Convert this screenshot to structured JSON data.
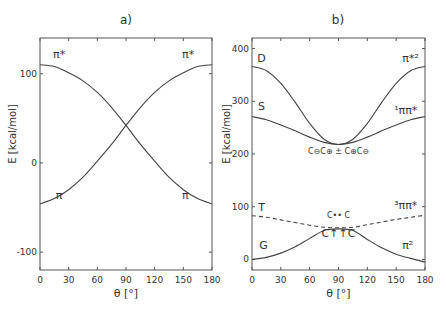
{
  "chart_data": [
    {
      "type": "line",
      "panel_label": "a)",
      "title": "a)",
      "xlabel": "θ [°]",
      "ylabel": "E [kcal/mol]",
      "xlim": [
        0,
        180
      ],
      "ylim": [
        -120,
        140
      ],
      "xticks": [
        0,
        30,
        60,
        90,
        120,
        150,
        180
      ],
      "yticks": [
        -100,
        0,
        100
      ],
      "grid": false,
      "x": [
        0,
        15,
        30,
        45,
        60,
        75,
        90,
        105,
        120,
        135,
        150,
        165,
        180
      ],
      "series": [
        {
          "name": "π*",
          "values": [
            110,
            108,
            101,
            92,
            79,
            62,
            42,
            21,
            2,
            -16,
            -30,
            -40,
            -46
          ]
        },
        {
          "name": "π",
          "values": [
            -46,
            -40,
            -30,
            -16,
            2,
            21,
            42,
            62,
            79,
            92,
            101,
            108,
            110
          ]
        }
      ],
      "annotations": [
        {
          "text": "π*",
          "x": 20,
          "y": 118
        },
        {
          "text": "π*",
          "x": 155,
          "y": 118
        },
        {
          "text": "π",
          "x": 20,
          "y": -40
        },
        {
          "text": "π",
          "x": 152,
          "y": -40
        }
      ]
    },
    {
      "type": "line",
      "panel_label": "b)",
      "title": "b)",
      "xlabel": "θ [°]",
      "ylabel": "E [kcal/mol]",
      "xlim": [
        0,
        180
      ],
      "ylim": [
        -20,
        420
      ],
      "xticks": [
        0,
        30,
        60,
        90,
        120,
        150,
        180
      ],
      "yticks": [
        0,
        100,
        200,
        300,
        400
      ],
      "grid": false,
      "x": [
        0,
        15,
        30,
        45,
        60,
        75,
        90,
        105,
        120,
        135,
        150,
        165,
        180
      ],
      "series": [
        {
          "name": "D (π*²)",
          "values": [
            366,
            358,
            334,
            298,
            258,
            228,
            218,
            228,
            258,
            298,
            334,
            358,
            366
          ]
        },
        {
          "name": "S (¹ππ*)",
          "values": [
            271,
            265,
            255,
            244,
            232,
            222,
            218,
            222,
            232,
            244,
            255,
            265,
            271
          ]
        },
        {
          "name": "T (³ππ*)",
          "values": [
            83,
            80,
            75,
            70,
            65,
            61,
            60,
            61,
            66,
            71,
            76,
            80,
            84
          ]
        },
        {
          "name": "G (π²)",
          "values": [
            0,
            4,
            12,
            24,
            40,
            55,
            58,
            55,
            38,
            22,
            10,
            2,
            -5
          ]
        }
      ],
      "series_styles": {
        "T (³ππ*)": "dashed"
      },
      "annotations": [
        {
          "text": "D",
          "x": 10,
          "y": 375
        },
        {
          "text": "S",
          "x": 10,
          "y": 283
        },
        {
          "text": "π*²",
          "x": 165,
          "y": 375
        },
        {
          "text": "¹ππ*",
          "x": 160,
          "y": 275
        },
        {
          "text": "C⊖C⊕ ± C⊕C⊖",
          "x": 90,
          "y": 200
        },
        {
          "text": "T",
          "x": 10,
          "y": 92
        },
        {
          "text": "³ππ*",
          "x": 160,
          "y": 96
        },
        {
          "text": "C•• C",
          "x": 90,
          "y": 78
        },
        {
          "text": "C↑↑C",
          "x": 90,
          "y": 42
        },
        {
          "text": "G",
          "x": 12,
          "y": 20
        },
        {
          "text": "π²",
          "x": 162,
          "y": 20
        }
      ]
    }
  ]
}
